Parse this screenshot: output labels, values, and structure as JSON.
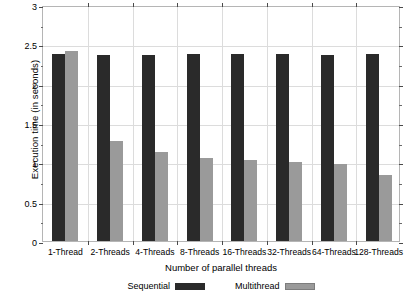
{
  "chart_data": {
    "type": "bar",
    "title": "",
    "xlabel": "Number of parallel threads",
    "ylabel": "Execution time (in seconds)",
    "categories": [
      "1-Thread",
      "2-Threads",
      "4-Threads",
      "8-Threads",
      "16-Threads",
      "32-Threads",
      "64-Threads",
      "128-Threads"
    ],
    "series": [
      {
        "name": "Sequential",
        "color": "#2a2a2a",
        "values": [
          2.38,
          2.37,
          2.37,
          2.38,
          2.38,
          2.38,
          2.37,
          2.38
        ]
      },
      {
        "name": "Multithread",
        "color": "#9a9a9a",
        "values": [
          2.42,
          1.27,
          1.13,
          1.06,
          1.03,
          1.01,
          0.98,
          0.84
        ]
      }
    ],
    "ylim": [
      0,
      3
    ],
    "yticks": [
      0,
      0.5,
      1,
      1.5,
      2,
      2.5,
      3
    ],
    "ytick_labels": [
      "0",
      "0.5",
      "1",
      "1.5",
      "2",
      "2.5",
      "3"
    ],
    "grid": true,
    "legend_position": "bottom"
  }
}
